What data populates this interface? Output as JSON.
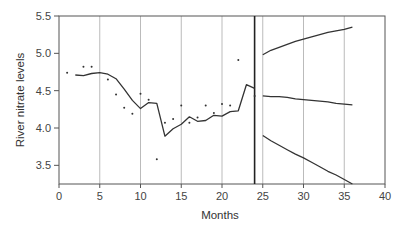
{
  "chart_data": {
    "type": "line",
    "title": "",
    "xlabel": "Months",
    "ylabel": "River nitrate levels",
    "xlim": [
      0,
      40
    ],
    "ylim": [
      3.25,
      5.5
    ],
    "x_ticks": [
      0,
      5,
      10,
      15,
      20,
      25,
      30,
      35,
      40
    ],
    "y_ticks": [
      3.5,
      4.0,
      4.5,
      5.0,
      5.5
    ],
    "grid": "vertical",
    "forecast_origin": 24,
    "series": [
      {
        "name": "observed",
        "style": "points",
        "x": [
          1,
          3,
          4,
          6,
          7,
          8,
          9,
          10,
          11,
          12,
          13,
          14,
          15,
          16,
          17,
          18,
          19,
          20,
          21,
          22,
          24
        ],
        "y": [
          4.74,
          4.82,
          4.82,
          4.65,
          4.45,
          4.27,
          4.19,
          4.46,
          4.38,
          3.58,
          4.07,
          4.12,
          4.3,
          4.07,
          4.14,
          4.3,
          4.2,
          4.32,
          4.3,
          4.91,
          4.43
        ]
      },
      {
        "name": "fitted",
        "style": "line",
        "x": [
          2,
          3,
          4,
          5,
          6,
          7,
          8,
          9,
          10,
          11,
          12,
          13,
          14,
          15,
          16,
          17,
          18,
          19,
          20,
          21,
          22,
          23,
          24
        ],
        "y": [
          4.71,
          4.7,
          4.73,
          4.74,
          4.72,
          4.66,
          4.52,
          4.37,
          4.26,
          4.34,
          4.33,
          3.89,
          3.99,
          4.05,
          4.15,
          4.09,
          4.1,
          4.17,
          4.16,
          4.22,
          4.23,
          4.58,
          4.53
        ]
      },
      {
        "name": "forecast-upper",
        "style": "line",
        "x": [
          25,
          26,
          27,
          28,
          29,
          30,
          31,
          32,
          33,
          34,
          35,
          36
        ],
        "y": [
          4.98,
          5.04,
          5.08,
          5.12,
          5.16,
          5.19,
          5.22,
          5.25,
          5.28,
          5.3,
          5.32,
          5.35
        ]
      },
      {
        "name": "forecast",
        "style": "line",
        "x": [
          25,
          26,
          27,
          28,
          29,
          30,
          31,
          32,
          33,
          34,
          35,
          36
        ],
        "y": [
          4.43,
          4.42,
          4.42,
          4.41,
          4.39,
          4.38,
          4.37,
          4.36,
          4.35,
          4.33,
          4.32,
          4.31
        ]
      },
      {
        "name": "forecast-lower",
        "style": "line",
        "x": [
          25,
          26,
          27,
          28,
          29,
          30,
          31,
          32,
          33,
          34,
          35,
          36
        ],
        "y": [
          3.9,
          3.83,
          3.77,
          3.71,
          3.65,
          3.6,
          3.54,
          3.48,
          3.42,
          3.37,
          3.31,
          3.25
        ]
      }
    ]
  },
  "axes": {
    "xlabel": "Months",
    "ylabel": "River nitrate levels"
  }
}
